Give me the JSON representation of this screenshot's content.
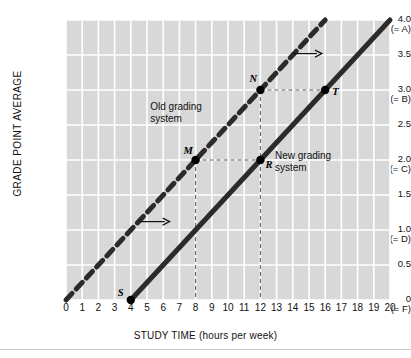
{
  "chart_data": {
    "type": "line",
    "title": "",
    "xlabel": "STUDY TIME (hours per week)",
    "ylabel": "GRADE POINT AVERAGE",
    "xlim": [
      0,
      20
    ],
    "ylim": [
      0,
      4.0
    ],
    "grid": true,
    "legend_position": "in-plot annotations",
    "xticks": [
      "0",
      "1",
      "2",
      "3",
      "4",
      "5",
      "6",
      "7",
      "8",
      "9",
      "10",
      "11",
      "12",
      "13",
      "14",
      "15",
      "16",
      "17",
      "18",
      "19",
      "20"
    ],
    "yticks": [
      {
        "value": "4.0",
        "letter": "(= A)"
      },
      {
        "value": "3.5",
        "letter": ""
      },
      {
        "value": "3.0",
        "letter": "(= B)"
      },
      {
        "value": "2.5",
        "letter": ""
      },
      {
        "value": "2.0",
        "letter": "(= C)"
      },
      {
        "value": "1.5",
        "letter": ""
      },
      {
        "value": "1.0",
        "letter": "(= D)"
      },
      {
        "value": "0.5",
        "letter": ""
      },
      {
        "value": "0",
        "letter": "(= F)"
      }
    ],
    "series": [
      {
        "name": "Old grading system",
        "style": "dashed",
        "color": "#2b2b2b",
        "x": [
          0,
          16
        ],
        "y": [
          0,
          4.0
        ],
        "slope": 0.25,
        "intercept": 0
      },
      {
        "name": "New grading system",
        "style": "solid",
        "color": "#2b2b2b",
        "x": [
          4,
          20
        ],
        "y": [
          0,
          4.0
        ],
        "slope": 0.25,
        "intercept": -1.0
      }
    ],
    "points": [
      {
        "label": "S",
        "x": 4,
        "y": 0.0,
        "series": "New grading system"
      },
      {
        "label": "M",
        "x": 8,
        "y": 2.0,
        "series": "Old grading system"
      },
      {
        "label": "N",
        "x": 12,
        "y": 3.0,
        "series": "Old grading system"
      },
      {
        "label": "R",
        "x": 12,
        "y": 2.0,
        "series": "New grading system"
      },
      {
        "label": "T",
        "x": 16,
        "y": 3.0,
        "series": "New grading system"
      }
    ],
    "annotations": [
      {
        "name": "old-system-label",
        "text": "Old grading\nsystem",
        "x": 5.2,
        "y": 2.85
      },
      {
        "name": "new-system-label",
        "text": "New grading\nsystem",
        "x": 12.9,
        "y": 2.15
      },
      {
        "name": "shift-arrow-upper",
        "x_from": 14.0,
        "x_to": 15.8,
        "y": 3.52
      },
      {
        "name": "shift-arrow-lower",
        "x_from": 4.6,
        "x_to": 6.4,
        "y": 1.12
      }
    ],
    "guide_lines": [
      {
        "from": "M",
        "to": "R",
        "orientation": "horizontal"
      },
      {
        "from": "N",
        "to": "T",
        "orientation": "horizontal"
      },
      {
        "from": "N",
        "to": "R",
        "orientation": "vertical"
      },
      {
        "from": "M",
        "to": "x-axis at 8",
        "orientation": "vertical"
      },
      {
        "from": "R",
        "to": "x-axis at 12",
        "orientation": "vertical"
      }
    ]
  },
  "colors": {
    "plot_background": "#d8d8d8",
    "grid": "#ffffff",
    "line": "#2b2b2b",
    "text": "#111111"
  }
}
